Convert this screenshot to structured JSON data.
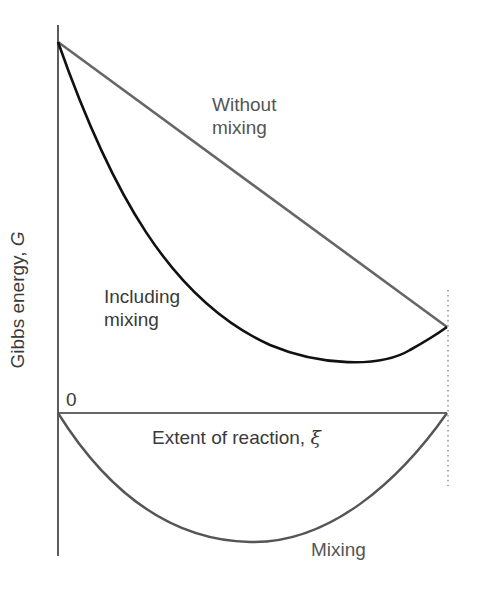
{
  "figure": {
    "type": "gibbs-energy-vs-extent-of-reaction",
    "y_axis_label": "Gibbs energy, ",
    "y_axis_symbol": "G",
    "x_axis_label": "Extent of reaction, ",
    "x_axis_symbol": "ξ",
    "origin_label": "0"
  },
  "curves": {
    "without_mixing": {
      "label_line1": "Without",
      "label_line2": "mixing",
      "color": "#666666",
      "shape": "straight line"
    },
    "including_mixing": {
      "label_line1": "Including",
      "label_line2": "mixing",
      "color": "#111111",
      "shape": "convex curve with minimum near right end"
    },
    "mixing": {
      "label": "Mixing",
      "color": "#555555",
      "shape": "parabola below x-axis"
    }
  },
  "colors": {
    "axis": "#333333",
    "dotted_marker": "#777777"
  }
}
